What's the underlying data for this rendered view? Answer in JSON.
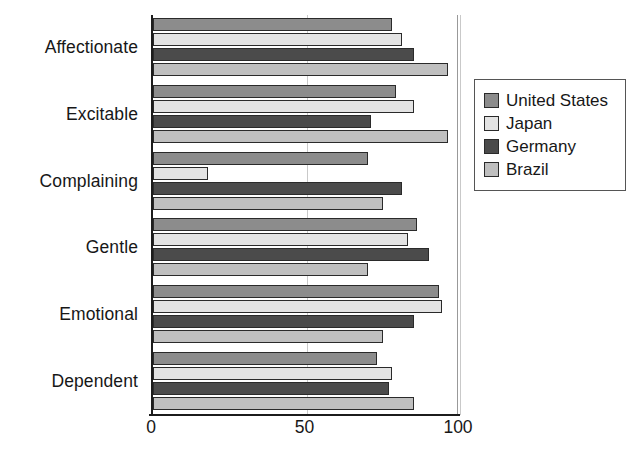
{
  "chart_data": {
    "type": "bar",
    "orientation": "horizontal",
    "title": "",
    "xlabel": "",
    "ylabel": "",
    "xlim": [
      0,
      100
    ],
    "xticks": [
      0,
      50,
      100
    ],
    "xtick_labels": [
      "0",
      "50",
      "100"
    ],
    "grid": true,
    "grid_axis": "x",
    "legend_position": "right",
    "categories": [
      "Affectionate",
      "Excitable",
      "Complaining",
      "Gentle",
      "Emotional",
      "Dependent"
    ],
    "series": [
      {
        "name": "United States",
        "color": "#8c8c8c",
        "values": [
          78,
          79,
          70,
          86,
          93,
          73
        ]
      },
      {
        "name": "Japan",
        "color": "#e3e3e3",
        "values": [
          81,
          85,
          18,
          83,
          94,
          78
        ]
      },
      {
        "name": "Germany",
        "color": "#4b4b4b",
        "values": [
          85,
          71,
          81,
          90,
          85,
          77
        ]
      },
      {
        "name": "Brazil",
        "color": "#bfbfbf",
        "values": [
          96,
          96,
          75,
          70,
          75,
          85
        ]
      }
    ]
  },
  "legend": {
    "items": [
      {
        "label": "United States",
        "color": "#8c8c8c"
      },
      {
        "label": "Japan",
        "color": "#e3e3e3"
      },
      {
        "label": "Germany",
        "color": "#4b4b4b"
      },
      {
        "label": "Brazil",
        "color": "#bfbfbf"
      }
    ]
  }
}
